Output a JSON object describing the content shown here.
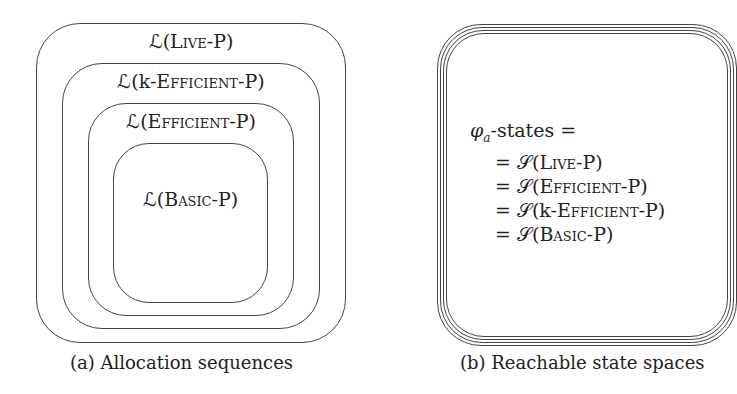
{
  "panel_a": {
    "caption": "(a) Allocation sequences",
    "sets": [
      {
        "prefix": "ℒ(",
        "name": "Live",
        "suffix": "-P)"
      },
      {
        "prefix": "ℒ(k-",
        "name": "Efficient",
        "suffix": "-P)"
      },
      {
        "prefix": "ℒ(",
        "name": "Efficient",
        "suffix": "-P)"
      },
      {
        "prefix": "ℒ(",
        "name": "Basic",
        "suffix": "-P)"
      }
    ]
  },
  "panel_b": {
    "caption": "(b) Reachable state spaces",
    "heading_sym": "φ",
    "heading_sub": "a",
    "heading_rest": "-states =",
    "lines": [
      {
        "prefix": "= 𝒮(",
        "name": "Live",
        "suffix": "-P)"
      },
      {
        "prefix": "= 𝒮(",
        "name": "Efficient",
        "suffix": "-P)"
      },
      {
        "prefix": "= 𝒮(k-",
        "name": "Efficient",
        "suffix": "-P)"
      },
      {
        "prefix": "= 𝒮(",
        "name": "Basic",
        "suffix": "-P)"
      }
    ]
  }
}
